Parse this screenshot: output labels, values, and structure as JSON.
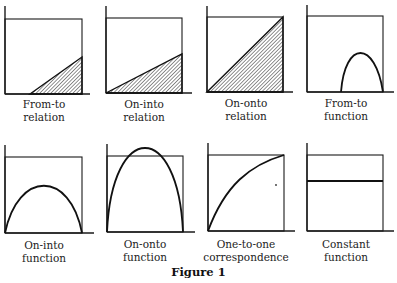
{
  "figure": {
    "caption": "Figure 1",
    "panels": [
      {
        "id": "from-to-relation",
        "line1": "From-to",
        "line2": "relation",
        "kind": "shaded-triangle-partial"
      },
      {
        "id": "on-into-relation",
        "line1": "On-into",
        "line2": "relation",
        "kind": "shaded-triangle-low"
      },
      {
        "id": "on-onto-relation",
        "line1": "On-onto",
        "line2": "relation",
        "kind": "shaded-triangle-full"
      },
      {
        "id": "from-to-function",
        "line1": "From-to",
        "line2": "function",
        "kind": "partial-arch"
      },
      {
        "id": "on-into-function",
        "line1": "On-into",
        "line2": "function",
        "kind": "low-arch"
      },
      {
        "id": "on-onto-function",
        "line1": "On-onto",
        "line2": "function",
        "kind": "full-arch"
      },
      {
        "id": "one-to-one-correspondence",
        "line1": "One-to-one",
        "line2": "correspondence",
        "kind": "increasing-concave-curve"
      },
      {
        "id": "constant-function",
        "line1": "Constant",
        "line2": "function",
        "kind": "horizontal-line"
      }
    ]
  }
}
